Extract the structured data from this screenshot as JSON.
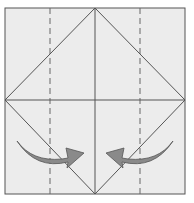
{
  "diagram": {
    "type": "origami-fold-step",
    "paper_color": "#ececec",
    "line_color": "#555555",
    "arrow_fill": "#8a8a8a",
    "arrow_stroke": "#555555",
    "elements": {
      "square": {
        "x": 5,
        "y": 8,
        "w": 180,
        "h": 186
      },
      "valley_folds": [
        50,
        140
      ],
      "arrows": [
        {
          "direction": "right",
          "label": "fold-left-flap-inward"
        },
        {
          "direction": "left",
          "label": "fold-right-flap-inward"
        }
      ]
    }
  }
}
